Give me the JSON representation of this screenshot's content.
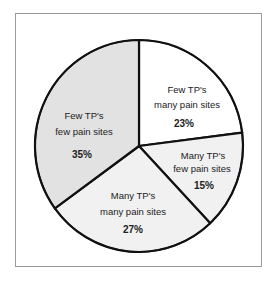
{
  "chart_data": {
    "type": "pie",
    "title": "",
    "start_angle_deg": 0,
    "direction": "clockwise",
    "slices": [
      {
        "label_line1": "Few TP's",
        "label_line2": "many pain sites",
        "value": 23,
        "pct_label": "23%",
        "color": "#ffffff"
      },
      {
        "label_line1": "Many TP's",
        "label_line2": "few pain sites",
        "value": 15,
        "pct_label": "15%",
        "color": "#f1f1f1"
      },
      {
        "label_line1": "Many TP's",
        "label_line2": "many pain sites",
        "value": 27,
        "pct_label": "27%",
        "color": "#f1f1f1"
      },
      {
        "label_line1": "Few TP's",
        "label_line2": "few pain sites",
        "value": 35,
        "pct_label": "35%",
        "color": "#e2e2e2"
      }
    ],
    "legend": "none",
    "border": true
  }
}
